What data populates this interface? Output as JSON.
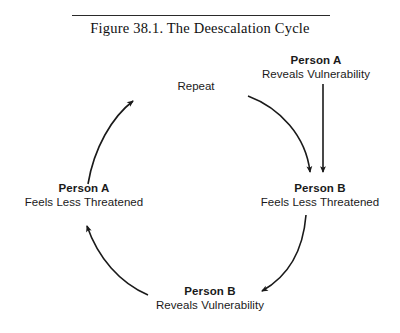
{
  "figure": {
    "title": "Figure 38.1.  The Deescalation Cycle",
    "rule": true
  },
  "diagram": {
    "type": "cycle-diagram",
    "nodes": [
      {
        "id": "person-a-reveals",
        "title": "Person A",
        "subtitle": "Reveals Vulnerability",
        "position": "top-right"
      },
      {
        "id": "person-b-feels",
        "title": "Person B",
        "subtitle": "Feels Less Threatened",
        "position": "right"
      },
      {
        "id": "person-b-reveals",
        "title": "Person B",
        "subtitle": "Reveals Vulnerability",
        "position": "bottom"
      },
      {
        "id": "person-a-feels",
        "title": "Person A",
        "subtitle": "Feels Less Threatened",
        "position": "left"
      }
    ],
    "annotations": [
      {
        "id": "repeat",
        "text": "Repeat",
        "position": "top-center"
      }
    ],
    "edges": [
      {
        "id": "edge-top-right",
        "from": "repeat-arc",
        "to": "person-b-feels",
        "style": "curved",
        "arrowhead": "end"
      },
      {
        "id": "edge-person-a-reveals-down",
        "from": "person-a-reveals",
        "to": "person-b-feels",
        "style": "straight-vertical",
        "arrowhead": "end"
      },
      {
        "id": "edge-right-bottom",
        "from": "person-b-feels",
        "to": "person-b-reveals",
        "style": "curved",
        "arrowhead": "end"
      },
      {
        "id": "edge-bottom-left",
        "from": "person-b-reveals",
        "to": "person-a-feels",
        "style": "curved",
        "arrowhead": "end"
      },
      {
        "id": "edge-left-top",
        "from": "person-a-feels",
        "to": "repeat",
        "style": "curved",
        "arrowhead": "end"
      }
    ],
    "stroke_color": "#1a1a1a",
    "background_color": "#ffffff"
  }
}
